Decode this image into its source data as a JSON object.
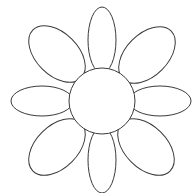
{
  "figure": {
    "stroke_color": "#3a3a3a",
    "fill_color": "#ffffff",
    "background": "#ffffff",
    "petal_count": 8,
    "petals": [
      {
        "name": "top",
        "cx": 102,
        "cy": 40,
        "rx": 14,
        "ry": 33,
        "rotate": 0
      },
      {
        "name": "upper-right",
        "cx": 147,
        "cy": 55,
        "rx": 34,
        "ry": 21,
        "rotate": -45
      },
      {
        "name": "right",
        "cx": 160,
        "cy": 101,
        "rx": 31,
        "ry": 15,
        "rotate": 0
      },
      {
        "name": "lower-right",
        "cx": 146,
        "cy": 147,
        "rx": 34,
        "ry": 21,
        "rotate": 45
      },
      {
        "name": "bottom",
        "cx": 102,
        "cy": 160,
        "rx": 14,
        "ry": 33,
        "rotate": 0
      },
      {
        "name": "lower-left",
        "cx": 57,
        "cy": 147,
        "rx": 34,
        "ry": 21,
        "rotate": -45
      },
      {
        "name": "left",
        "cx": 42,
        "cy": 101,
        "rx": 31,
        "ry": 15,
        "rotate": 0
      },
      {
        "name": "upper-left",
        "cx": 57,
        "cy": 54,
        "rx": 34,
        "ry": 21,
        "rotate": 45
      }
    ],
    "center": {
      "cx": 102,
      "cy": 101,
      "r": 33
    }
  }
}
